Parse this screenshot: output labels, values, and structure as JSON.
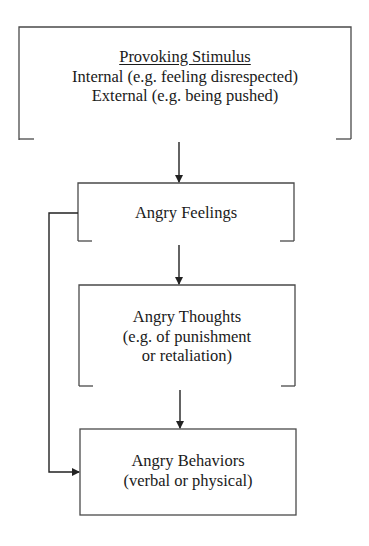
{
  "diagram": {
    "type": "flowchart",
    "colors": {
      "line": "#3a3a3a",
      "text": "#1a1a1a",
      "background": "#ffffff"
    },
    "nodes": [
      {
        "id": "provoking-stimulus",
        "title": "Provoking Stimulus",
        "lines": [
          "Internal (e.g. feeling disrespected)",
          "External (e.g. being pushed)"
        ],
        "bottom_open": true
      },
      {
        "id": "angry-feelings",
        "title": "Angry Feelings",
        "lines": [],
        "bottom_open": true
      },
      {
        "id": "angry-thoughts",
        "title": "Angry Thoughts",
        "lines": [
          "(e.g. of punishment",
          "or retaliation)"
        ],
        "bottom_open": true
      },
      {
        "id": "angry-behaviors",
        "title": "Angry Behaviors",
        "lines": [
          "(verbal or physical)"
        ],
        "bottom_open": false
      }
    ],
    "edges": [
      {
        "from": "provoking-stimulus",
        "to": "angry-feelings"
      },
      {
        "from": "angry-feelings",
        "to": "angry-thoughts"
      },
      {
        "from": "angry-thoughts",
        "to": "angry-behaviors"
      },
      {
        "from": "angry-feelings",
        "to": "angry-behaviors",
        "route": "left-bypass"
      }
    ]
  }
}
